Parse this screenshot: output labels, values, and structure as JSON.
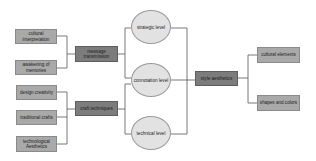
{
  "diagram": {
    "left_leaves": [
      {
        "id": "cultural-interpretation",
        "label": "cultural interpretation"
      },
      {
        "id": "awakening-of-memories",
        "label": "awakening of memories"
      },
      {
        "id": "design-creativity",
        "label": "design creativity"
      },
      {
        "id": "traditional-crafts",
        "label": "traditional crafts"
      },
      {
        "id": "technological-aesthetics",
        "label": "technological Aesthetics"
      }
    ],
    "left_groups": [
      {
        "id": "message-transmission",
        "label": "message transmission"
      },
      {
        "id": "craft-techniques",
        "label": "craft techniques"
      }
    ],
    "levels": [
      {
        "id": "strategic-level",
        "label": "strategic level"
      },
      {
        "id": "connotation-level",
        "label": "connotation level"
      },
      {
        "id": "technical-level",
        "label": "technical level"
      }
    ],
    "center": {
      "id": "style-aesthetics",
      "label": "style aesthetics"
    },
    "right_leaves": [
      {
        "id": "cultural-elements",
        "label": "cultural elements"
      },
      {
        "id": "shapes-and-colors",
        "label": "shapes and colors"
      }
    ],
    "colors": {
      "light_box": "#a9a9a9",
      "dark_box": "#7c7c7c",
      "ellipse": "#e2e2e2",
      "line": "#555555"
    }
  }
}
